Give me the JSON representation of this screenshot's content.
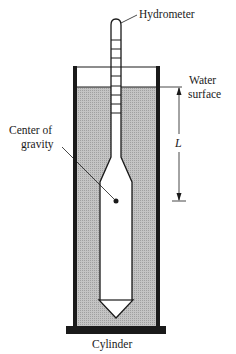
{
  "diagram": {
    "labels": {
      "hydrometer": "Hydrometer",
      "water_surface_line1": "Water",
      "water_surface_line2": "surface",
      "length": "L",
      "center_of_gravity_line1": "Center of",
      "center_of_gravity_line2": "gravity",
      "cylinder": "Cylinder"
    },
    "colors": {
      "liquid": "#b3b3b3",
      "outline": "#1a1a1a",
      "background": "#ffffff"
    }
  }
}
